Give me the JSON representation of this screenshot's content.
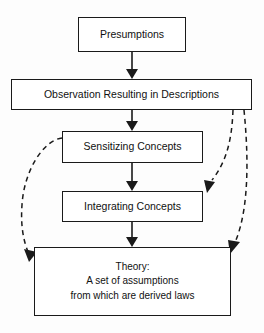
{
  "diagram": {
    "colors": {
      "stroke": "#1a1a1a",
      "box_fill": "#ffffff",
      "background": "#fdfdfd",
      "dashed_stroke": "#1a1a1a"
    },
    "nodes": [
      {
        "id": "presumptions",
        "label": "Presumptions",
        "x": 78,
        "y": 17,
        "w": 108,
        "h": 35
      },
      {
        "id": "observation",
        "label": "Observation Resulting in Descriptions",
        "x": 11,
        "y": 79,
        "w": 241,
        "h": 31
      },
      {
        "id": "sensitizing",
        "label": "Sensitizing Concepts",
        "x": 62,
        "y": 131,
        "w": 141,
        "h": 32
      },
      {
        "id": "integrating",
        "label": "Integrating Concepts",
        "x": 62,
        "y": 191,
        "w": 141,
        "h": 31
      },
      {
        "id": "theory",
        "label_line1": "Theory:",
        "label_line2": "A set of assumptions",
        "label_line3": "from which are derived laws",
        "x": 34,
        "y": 247,
        "w": 197,
        "h": 69
      }
    ],
    "edges": [
      {
        "id": "presumptions-to-observation",
        "from": "presumptions",
        "to": "observation",
        "style": "solid",
        "direction": "down"
      },
      {
        "id": "observation-to-sensitizing",
        "from": "observation",
        "to": "sensitizing",
        "style": "solid",
        "direction": "down"
      },
      {
        "id": "sensitizing-to-integrating",
        "from": "sensitizing",
        "to": "integrating",
        "style": "solid",
        "direction": "down"
      },
      {
        "id": "integrating-to-theory",
        "from": "integrating",
        "to": "theory",
        "style": "solid",
        "direction": "down"
      },
      {
        "id": "sensitizing-to-theory-feedback",
        "from": "sensitizing",
        "to": "theory",
        "style": "dashed",
        "direction": "curve-left-down"
      },
      {
        "id": "observation-to-integrating-feedback",
        "from": "observation",
        "to": "integrating",
        "style": "dashed",
        "direction": "curve-right-down"
      },
      {
        "id": "observation-to-theory-feedback",
        "from": "observation",
        "to": "theory",
        "style": "dashed",
        "direction": "curve-right-down"
      }
    ]
  }
}
